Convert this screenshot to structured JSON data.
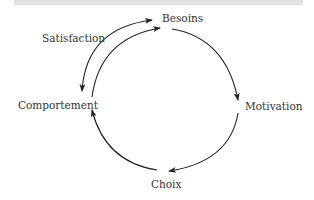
{
  "diagram": {
    "type": "cycle",
    "nodes": {
      "besoins": "Besoins",
      "motivation": "Motivation",
      "choix": "Choix",
      "comportement": "Comportement"
    },
    "edge_labels": {
      "satisfaction": "Satisfaction"
    },
    "edges": [
      {
        "from": "Besoins",
        "to": "Motivation"
      },
      {
        "from": "Motivation",
        "to": "Choix"
      },
      {
        "from": "Choix",
        "to": "Comportement"
      },
      {
        "from": "Comportement",
        "to": "Besoins"
      },
      {
        "from": "Besoins",
        "to": "Comportement",
        "label": "Satisfaction",
        "bidirectional": true
      }
    ],
    "colors": {
      "line": "#222222",
      "text": "#333333",
      "top_bar": "#e2e2e2"
    }
  }
}
